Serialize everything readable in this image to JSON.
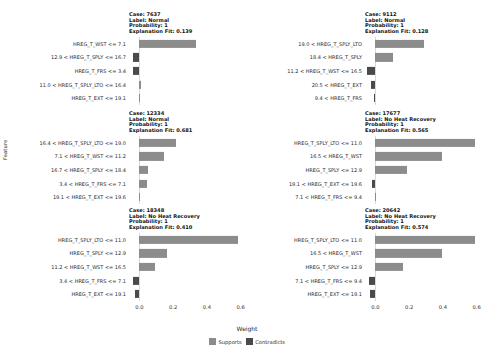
{
  "chart_data": {
    "type": "bar",
    "title": "",
    "xlabel": "Weight",
    "ylabel": "Feature",
    "xlim": [
      -0.08,
      0.62
    ],
    "xticks": [
      "0.0",
      "0.2",
      "0.4",
      "0.6"
    ],
    "xtickvals": [
      0.0,
      0.2,
      0.4,
      0.6
    ],
    "grid": false,
    "legend": {
      "position": "bottom",
      "entries": [
        {
          "label": "Supports",
          "color": "#8c8c8c"
        },
        {
          "label": "Contradicts",
          "color": "#4a4a4a"
        }
      ]
    },
    "facets": [
      {
        "case_label": "Case: 7637",
        "label_label": "Label: Normal",
        "probability_label": "Probability: 1",
        "fit_label": "Explanation Fit: 0.139",
        "case": 7637,
        "class_label": "Normal",
        "probability": 1,
        "explanation_fit": 0.139,
        "features": [
          {
            "label": "HREG_T_WST <= 7.1",
            "weight": 0.337,
            "type": "Supports"
          },
          {
            "label": "12.9 < HREG_T_SPLY <= 16.7",
            "weight": -0.036,
            "type": "Contradicts"
          },
          {
            "label": "HREG_T_FRS <= 3.4",
            "weight": -0.036,
            "type": "Contradicts"
          },
          {
            "label": "11.0 < HREG_T_SPLY_LTO <= 16.4",
            "weight": 0.009,
            "type": "Supports"
          },
          {
            "label": "HREG_T_EXT <= 19.1",
            "weight": 0.006,
            "type": "Supports"
          }
        ]
      },
      {
        "case_label": "Case: 9112",
        "label_label": "Label: Normal",
        "probability_label": "Probability: 1",
        "fit_label": "Explanation Fit: 0.128",
        "case": 9112,
        "class_label": "Normal",
        "probability": 1,
        "explanation_fit": 0.128,
        "features": [
          {
            "label": "19.0 < HREG_T_SPLY_LTO",
            "weight": 0.289,
            "type": "Supports"
          },
          {
            "label": "18.4 < HREG_T_SPLY",
            "weight": 0.104,
            "type": "Supports"
          },
          {
            "label": "11.2 < HREG_T_WST <= 16.5",
            "weight": -0.053,
            "type": "Contradicts"
          },
          {
            "label": "20.5 < HREG_T_EXT",
            "weight": -0.025,
            "type": "Contradicts"
          },
          {
            "label": "9.4 < HREG_T_FRS",
            "weight": -0.006,
            "type": "Contradicts"
          }
        ]
      },
      {
        "case_label": "Case: 12334",
        "label_label": "Label: Normal",
        "probability_label": "Probability: 1",
        "fit_label": "Explanation Fit: 0.681",
        "case": 12334,
        "class_label": "Normal",
        "probability": 1,
        "explanation_fit": 0.681,
        "features": [
          {
            "label": "16.4 < HREG_T_SPLY_LTO <= 19.0",
            "weight": 0.218,
            "type": "Supports"
          },
          {
            "label": "7.1 < HREG_T_WST <= 11.2",
            "weight": 0.148,
            "type": "Supports"
          },
          {
            "label": "16.7 < HREG_T_SPLY <= 18.4",
            "weight": 0.049,
            "type": "Supports"
          },
          {
            "label": "3.4 < HREG_T_FRS <= 7.1",
            "weight": 0.042,
            "type": "Supports"
          },
          {
            "label": "19.1 < HREG_T_EXT <= 19.6",
            "weight": 0.004,
            "type": "Supports"
          }
        ]
      },
      {
        "case_label": "Case: 17677",
        "label_label": "Label: No Heat Recovery",
        "probability_label": "Probability: 1",
        "fit_label": "Explanation Fit: 0.565",
        "case": 17677,
        "class_label": "No Heat Recovery",
        "probability": 1,
        "explanation_fit": 0.565,
        "features": [
          {
            "label": "HREG_T_SPLY_LTO <= 11.0",
            "weight": 0.589,
            "type": "Supports"
          },
          {
            "label": "16.5 < HREG_T_WST",
            "weight": 0.392,
            "type": "Supports"
          },
          {
            "label": "HREG_T_SPLY <= 12.9",
            "weight": 0.184,
            "type": "Supports"
          },
          {
            "label": "19.1 < HREG_T_EXT <= 19.6",
            "weight": -0.022,
            "type": "Contradicts"
          },
          {
            "label": "7.1 < HREG_T_FRS <= 9.4",
            "weight": 0.003,
            "type": "Supports"
          }
        ]
      },
      {
        "case_label": "Case: 18348",
        "label_label": "Label: No Heat Recovery",
        "probability_label": "Probability: 1",
        "fit_label": "Explanation Fit: 0.410",
        "case": 18348,
        "class_label": "No Heat Recovery",
        "probability": 1,
        "explanation_fit": 0.41,
        "features": [
          {
            "label": "HREG_T_SPLY_LTO <= 11.0",
            "weight": 0.585,
            "type": "Supports"
          },
          {
            "label": "HREG_T_SPLY <= 12.9",
            "weight": 0.162,
            "type": "Supports"
          },
          {
            "label": "11.2 < HREG_T_WST <= 16.5",
            "weight": 0.095,
            "type": "Supports"
          },
          {
            "label": "3.4 < HREG_T_FRS <= 7.1",
            "weight": -0.038,
            "type": "Contradicts"
          },
          {
            "label": "HREG_T_EXT <= 19.1",
            "weight": -0.024,
            "type": "Contradicts"
          }
        ]
      },
      {
        "case_label": "Case: 20642",
        "label_label": "Label: No Heat Recovery",
        "probability_label": "Probability: 1",
        "fit_label": "Explanation Fit: 0.574",
        "case": 20642,
        "class_label": "No Heat Recovery",
        "probability": 1,
        "explanation_fit": 0.574,
        "features": [
          {
            "label": "HREG_T_SPLY_LTO <= 11.0",
            "weight": 0.592,
            "type": "Supports"
          },
          {
            "label": "16.5 < HREG_T_WST",
            "weight": 0.392,
            "type": "Supports"
          },
          {
            "label": "HREG_T_SPLY <= 12.9",
            "weight": 0.165,
            "type": "Supports"
          },
          {
            "label": "7.1 < HREG_T_FRS <= 9.4",
            "weight": -0.038,
            "type": "Contradicts"
          },
          {
            "label": "HREG_T_EXT <= 19.1",
            "weight": -0.031,
            "type": "Contradicts"
          }
        ]
      }
    ]
  }
}
